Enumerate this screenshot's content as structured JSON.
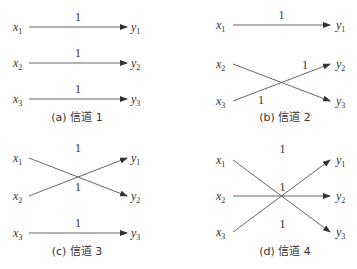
{
  "figure": {
    "panels": [
      {
        "id": "a",
        "caption": "(a) 信道 1",
        "inputs": [
          "x1",
          "x2",
          "x3"
        ],
        "outputs": [
          "y1",
          "y2",
          "y3"
        ],
        "edges": [
          {
            "from": 1,
            "to": 1,
            "weight": "1"
          },
          {
            "from": 2,
            "to": 2,
            "weight": "1"
          },
          {
            "from": 3,
            "to": 3,
            "weight": "1"
          }
        ]
      },
      {
        "id": "b",
        "caption": "(b) 信道 2",
        "inputs": [
          "x1",
          "x2",
          "x3"
        ],
        "outputs": [
          "y1",
          "y2",
          "y3"
        ],
        "edges": [
          {
            "from": 1,
            "to": 1,
            "weight": "1"
          },
          {
            "from": 2,
            "to": 3,
            "weight": "1"
          },
          {
            "from": 3,
            "to": 2,
            "weight": "1"
          }
        ]
      },
      {
        "id": "c",
        "caption": "(c) 信道 3",
        "inputs": [
          "x1",
          "x2",
          "x3"
        ],
        "outputs": [
          "y1",
          "y2",
          "y3"
        ],
        "edges": [
          {
            "from": 1,
            "to": 2,
            "weight": "1"
          },
          {
            "from": 2,
            "to": 1,
            "weight": "1"
          },
          {
            "from": 3,
            "to": 3,
            "weight": "1"
          }
        ]
      },
      {
        "id": "d",
        "caption": "(d) 信道 4",
        "inputs": [
          "x1",
          "x2",
          "x3"
        ],
        "outputs": [
          "y1",
          "y2",
          "y3"
        ],
        "edges": [
          {
            "from": 1,
            "to": 3,
            "weight": "1"
          },
          {
            "from": 2,
            "to": 2,
            "weight": "1"
          },
          {
            "from": 3,
            "to": 1,
            "weight": "1"
          }
        ]
      }
    ]
  }
}
